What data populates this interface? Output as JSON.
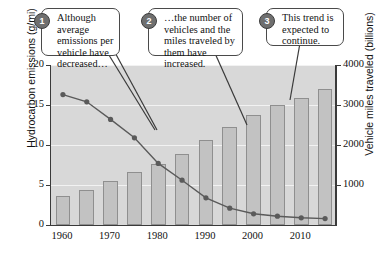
{
  "chart_data": {
    "type": "bar",
    "title": "",
    "xlabel": "",
    "ylabel": "Hydrocarbon emissions (g/mi)",
    "y2label": "Vehicle miles traveled (billions)",
    "x": [
      1960,
      1965,
      1970,
      1975,
      1980,
      1985,
      1990,
      1995,
      2000,
      2005,
      2010,
      2015
    ],
    "xtick_labels": [
      "1960",
      "1970",
      "1980",
      "1990",
      "2000",
      "2010"
    ],
    "xtick_values": [
      1960,
      1970,
      1980,
      1990,
      2000,
      2010
    ],
    "ylim": [
      0,
      20
    ],
    "ytick_labels": [
      "0",
      "5",
      "10",
      "15",
      "20"
    ],
    "ytick_values": [
      0,
      5,
      10,
      15,
      20
    ],
    "y2lim": [
      0,
      4000
    ],
    "y2tick_labels": [
      "1000",
      "2000",
      "3000",
      "4000"
    ],
    "y2tick_values": [
      1000,
      2000,
      3000,
      4000
    ],
    "grid": true,
    "legend": "none",
    "series": [
      {
        "name": "Vehicle miles traveled (billions)",
        "type": "bar",
        "axis": "right",
        "color": "#c2c2c2",
        "values": [
          720,
          880,
          1110,
          1330,
          1530,
          1780,
          2130,
          2440,
          2760,
          3000,
          3170,
          3400
        ]
      },
      {
        "name": "Hydrocarbon emissions (g/mi)",
        "type": "line",
        "axis": "left",
        "color": "#5a5a5a",
        "values": [
          16.3,
          15.4,
          13.2,
          10.9,
          7.7,
          5.6,
          3.4,
          2.1,
          1.4,
          1.1,
          0.9,
          0.8
        ]
      }
    ]
  },
  "callouts": [
    {
      "number": "1",
      "text": "Although average emissions per vehicle have decreased…"
    },
    {
      "number": "2",
      "text": "…the number of vehicles and the miles traveled by them have increased."
    },
    {
      "number": "3",
      "text": "This trend is expected to continue."
    }
  ]
}
